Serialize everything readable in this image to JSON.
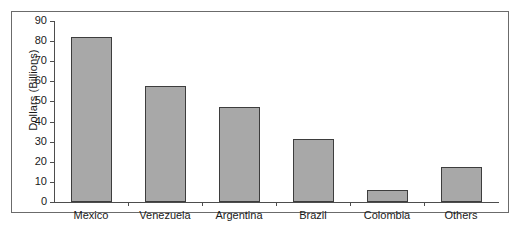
{
  "chart_data": {
    "type": "bar",
    "title": "",
    "xlabel": "",
    "ylabel": "Dollars (Billions)",
    "categories": [
      "Mexico",
      "Venezuela",
      "Argentina",
      "Brazil",
      "Colombia",
      "Others"
    ],
    "values": [
      82,
      57.5,
      47,
      31.5,
      6,
      17.5
    ],
    "ylim": [
      0,
      90
    ],
    "yticks": [
      0,
      10,
      20,
      30,
      40,
      50,
      60,
      70,
      80,
      90
    ],
    "ytick_labels": [
      "0",
      "10",
      "20",
      "30",
      "40",
      "50",
      "60",
      "70",
      "80",
      "90"
    ],
    "grid": false,
    "legend": false,
    "bar_color": "#a8a8a8",
    "bar_border_color": "#3d3d3d",
    "axis_color": "#4d4d4d",
    "frame_color": "#6b6b6b",
    "background": "#ffffff"
  }
}
